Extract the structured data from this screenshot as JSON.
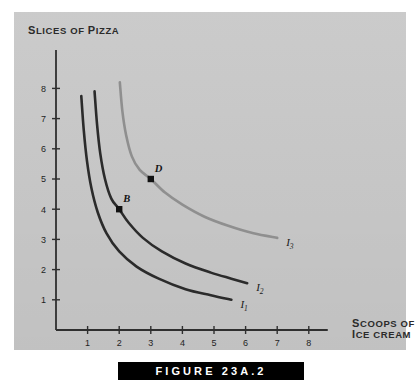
{
  "figure": {
    "caption": "FIGURE 23A.2",
    "panel_color": "#c9c9c9"
  },
  "chart_data": {
    "type": "line",
    "title": "",
    "xlabel": "SCOOPS OF ICE CREAM",
    "ylabel": "SLICES OF PIZZA",
    "xlim": [
      0,
      8.6
    ],
    "ylim": [
      0,
      8.8
    ],
    "xticks": [
      1,
      2,
      3,
      4,
      5,
      6,
      7,
      8
    ],
    "yticks": [
      1,
      2,
      3,
      4,
      5,
      6,
      7,
      8
    ],
    "grid": false,
    "legend": "inline-curve-labels",
    "series": [
      {
        "name": "I1",
        "label": "I",
        "subscript": "1",
        "color": "#2b2b2b",
        "points": [
          [
            0.8,
            7.75
          ],
          [
            0.88,
            6.6
          ],
          [
            0.98,
            5.6
          ],
          [
            1.12,
            4.7
          ],
          [
            1.32,
            3.9
          ],
          [
            1.6,
            3.2
          ],
          [
            2.0,
            2.6
          ],
          [
            2.55,
            2.1
          ],
          [
            3.25,
            1.7
          ],
          [
            4.1,
            1.35
          ],
          [
            4.9,
            1.15
          ],
          [
            5.55,
            1.0
          ]
        ]
      },
      {
        "name": "I2",
        "label": "I",
        "subscript": "2",
        "color": "#2b2b2b",
        "points": [
          [
            1.22,
            7.9
          ],
          [
            1.3,
            6.8
          ],
          [
            1.4,
            5.85
          ],
          [
            1.55,
            5.0
          ],
          [
            1.75,
            4.35
          ],
          [
            2.0,
            4.0
          ],
          [
            2.3,
            3.55
          ],
          [
            2.75,
            3.05
          ],
          [
            3.35,
            2.6
          ],
          [
            4.1,
            2.2
          ],
          [
            4.9,
            1.9
          ],
          [
            5.55,
            1.7
          ],
          [
            6.05,
            1.55
          ]
        ]
      },
      {
        "name": "I3",
        "label": "I",
        "subscript": "3",
        "color": "#8f8f8f",
        "points": [
          [
            2.02,
            8.2
          ],
          [
            2.1,
            7.25
          ],
          [
            2.22,
            6.45
          ],
          [
            2.4,
            5.75
          ],
          [
            2.65,
            5.3
          ],
          [
            3.0,
            5.0
          ],
          [
            3.45,
            4.55
          ],
          [
            4.0,
            4.15
          ],
          [
            4.7,
            3.75
          ],
          [
            5.45,
            3.45
          ],
          [
            6.25,
            3.2
          ],
          [
            7.0,
            3.05
          ]
        ]
      }
    ],
    "annotations": [
      {
        "label": "B",
        "x": 2,
        "y": 4,
        "on_series": "I2",
        "marker": "filled-square"
      },
      {
        "label": "D",
        "x": 3,
        "y": 5,
        "on_series": "I3",
        "marker": "filled-square"
      }
    ]
  }
}
